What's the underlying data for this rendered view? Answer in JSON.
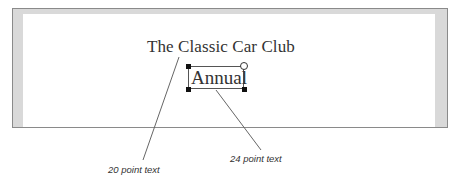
{
  "document": {
    "title_text": "The Classic Car Club",
    "selected_text": "Annual"
  },
  "callouts": [
    {
      "label": "20 point text",
      "target": "title_text"
    },
    {
      "label": "24 point text",
      "target": "selected_text"
    }
  ],
  "colors": {
    "frame_border": "#8a8a8a",
    "frame_margin": "#d9d9d9",
    "page": "#ffffff",
    "leader_line": "#666666"
  }
}
